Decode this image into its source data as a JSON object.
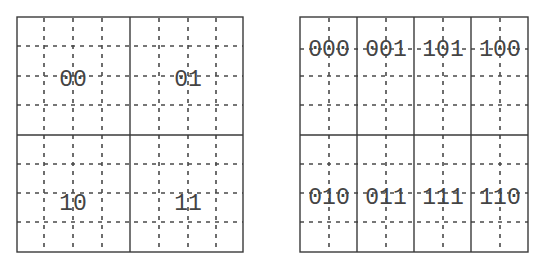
{
  "diagram": {
    "type": "karnaugh-map-grids",
    "left_map": {
      "name": "2-bit map",
      "rows": 2,
      "cols": 2,
      "cells": [
        {
          "row": 0,
          "col": 0,
          "label": "00"
        },
        {
          "row": 0,
          "col": 1,
          "label": "01"
        },
        {
          "row": 1,
          "col": 0,
          "label": "10"
        },
        {
          "row": 1,
          "col": 1,
          "label": "11"
        }
      ]
    },
    "right_map": {
      "name": "3-bit map",
      "rows": 2,
      "cols": 4,
      "cells": [
        {
          "row": 0,
          "col": 0,
          "label": "000"
        },
        {
          "row": 0,
          "col": 1,
          "label": "001"
        },
        {
          "row": 0,
          "col": 2,
          "label": "101"
        },
        {
          "row": 0,
          "col": 3,
          "label": "100"
        },
        {
          "row": 1,
          "col": 0,
          "label": "010"
        },
        {
          "row": 1,
          "col": 1,
          "label": "011"
        },
        {
          "row": 1,
          "col": 2,
          "label": "111"
        },
        {
          "row": 1,
          "col": 3,
          "label": "110"
        }
      ]
    }
  }
}
